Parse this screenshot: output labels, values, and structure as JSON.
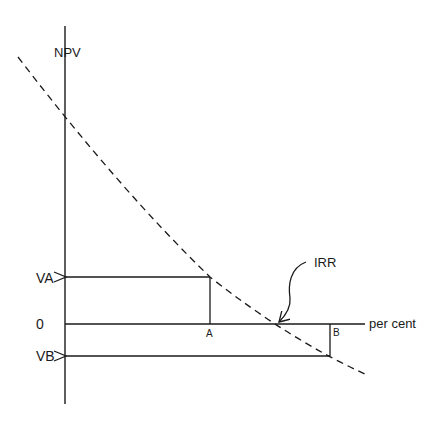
{
  "diagram": {
    "type": "npv-profile",
    "labels": {
      "y_axis": "NPV",
      "x_axis": "per cent",
      "zero": "0",
      "va": "VA",
      "vb": "VB",
      "point_a": "A",
      "point_b": "B",
      "irr": "IRR"
    },
    "colors": {
      "ink": "#1a1a1a",
      "background": "#ffffff"
    },
    "geometry": {
      "y_axis": {
        "x": 65,
        "y_top": 26,
        "y_bottom": 404
      },
      "x_axis": {
        "y": 324,
        "x_start": 65,
        "x_end": 365
      },
      "npv_curve": {
        "style": "dashed",
        "points": [
          [
            18,
            57
          ],
          [
            65,
            123
          ],
          [
            100,
            163
          ],
          [
            150,
            218
          ],
          [
            210,
            277
          ],
          [
            245,
            297
          ],
          [
            278,
            324
          ],
          [
            330,
            356
          ],
          [
            365,
            374
          ]
        ]
      },
      "point_a": {
        "x": 210,
        "npv_y": 277
      },
      "point_b": {
        "x": 330,
        "npv_y": 356
      },
      "irr_point": {
        "x": 278,
        "y": 324
      }
    }
  }
}
